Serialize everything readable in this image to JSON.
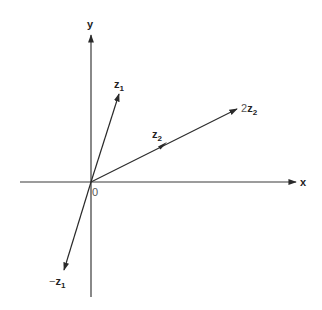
{
  "diagram": {
    "title": "",
    "axes": {
      "x_label": "x",
      "y_label": "y",
      "origin_label": "0"
    },
    "vectors": [
      {
        "id": "z1",
        "label_main": "z",
        "label_sub": "1",
        "label_prefix": "",
        "dx": 1.0,
        "dy": 3.1
      },
      {
        "id": "neg-z1",
        "label_main": "z",
        "label_sub": "1",
        "label_prefix": "−",
        "dx": -1.0,
        "dy": -3.1
      },
      {
        "id": "z2",
        "label_main": "z",
        "label_sub": "2",
        "label_prefix": "",
        "dx": 2.5,
        "dy": 1.3
      },
      {
        "id": "2z2",
        "label_main": "z",
        "label_sub": "2",
        "label_prefix": "2",
        "dx": 5.0,
        "dy": 2.6
      }
    ],
    "colors": {
      "line": "#2a2a2a",
      "axis": "#3a3a3a",
      "background": "#ffffff"
    }
  }
}
